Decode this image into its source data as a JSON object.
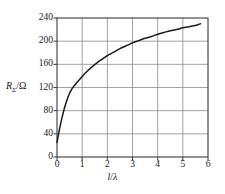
{
  "figure": {
    "background_color": "#ffffff",
    "frame_color": "#3a3a3a",
    "grid_color": "#8c8c8c",
    "curve_color": "#1a1a1a",
    "text_color": "#1a1a1a"
  },
  "labels": {
    "y_axis_symbol": "R",
    "y_axis_subscript": "Σ",
    "y_axis_divider": "/",
    "y_axis_unit": "Ω",
    "x_axis_numerator": "l",
    "x_axis_divider": "/",
    "x_axis_denominator": "λ"
  },
  "chart_data": {
    "type": "line",
    "title": "",
    "xlabel": "l/λ",
    "ylabel": "RΣ/Ω",
    "xlim": [
      0,
      6
    ],
    "ylim": [
      0,
      240
    ],
    "xticks": [
      0,
      1,
      2,
      3,
      4,
      5,
      6
    ],
    "xtick_labels": [
      "0",
      "1",
      "2",
      "3",
      "4",
      "5",
      "6"
    ],
    "yticks": [
      0,
      40,
      80,
      120,
      160,
      200,
      240
    ],
    "ytick_labels": [
      "0",
      "40",
      "80",
      "120",
      "160",
      "200",
      "240"
    ],
    "grid": true,
    "legend": null,
    "series": [
      {
        "name": "radiation-resistance",
        "x": [
          0.0,
          0.1,
          0.2,
          0.3,
          0.4,
          0.5,
          0.6,
          0.7,
          0.8,
          0.9,
          1.0,
          1.2,
          1.4,
          1.6,
          1.8,
          2.0,
          2.25,
          2.5,
          2.75,
          3.0,
          3.25,
          3.5,
          3.75,
          4.0,
          4.25,
          4.5,
          4.75,
          5.0,
          5.25,
          5.5,
          5.7
        ],
        "y": [
          25,
          48,
          68,
          85,
          99,
          110,
          118,
          124,
          129,
          134,
          139,
          148,
          156,
          163,
          169,
          175,
          181,
          187,
          192,
          197,
          201,
          205,
          208,
          212,
          215,
          218,
          220,
          223,
          225,
          227,
          230
        ]
      }
    ]
  }
}
